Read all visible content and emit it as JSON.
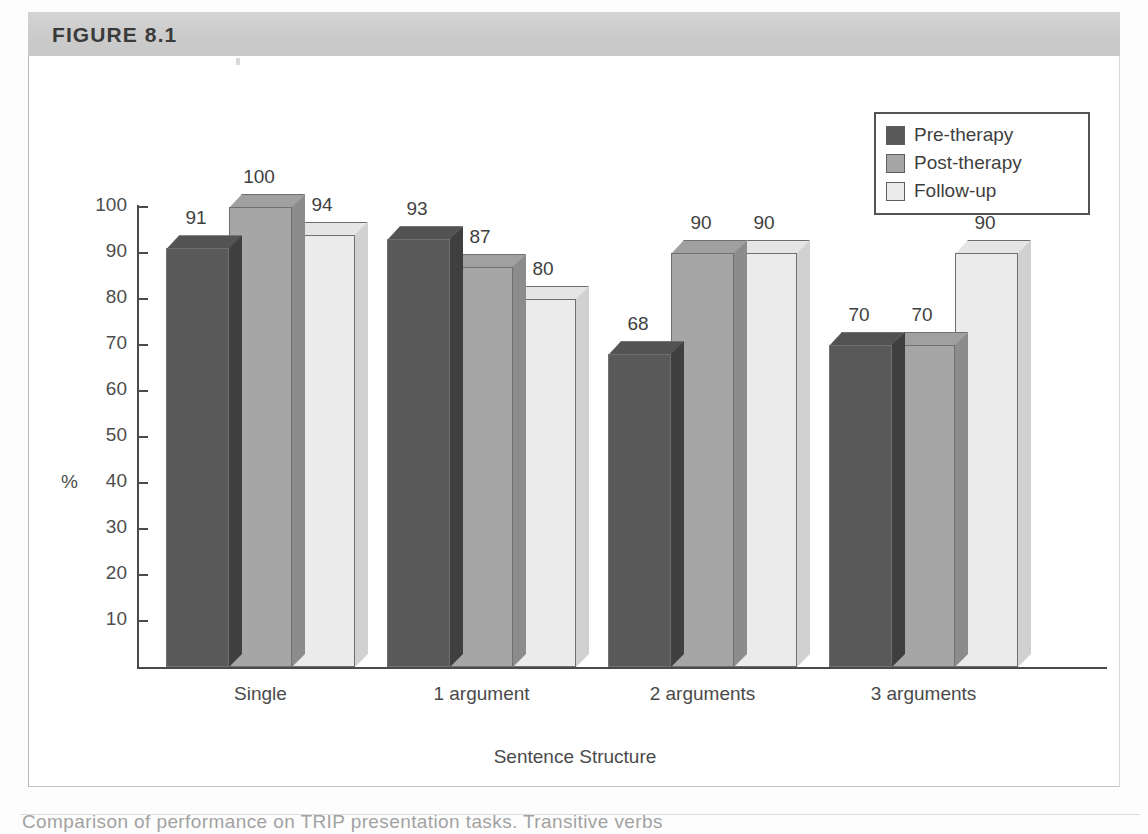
{
  "figure": {
    "label": "FIGURE 8.1",
    "header_color": "#cfcfcf"
  },
  "caption": {
    "text": "Comparison of performance on TRIP presentation tasks. Transitive verbs"
  },
  "legend": {
    "position": "top-right",
    "items": [
      {
        "label": "Pre-therapy",
        "color": "#595959",
        "swatch_icon": "square-swatch-dark"
      },
      {
        "label": "Post-therapy",
        "color": "#a6a6a6",
        "swatch_icon": "square-swatch-medium"
      },
      {
        "label": "Follow-up",
        "color": "#ebebeb",
        "swatch_icon": "square-swatch-light"
      }
    ]
  },
  "chart_data": {
    "type": "bar",
    "title": "FIGURE 8.1",
    "xlabel": "Sentence Structure",
    "ylabel": "%",
    "ylim": [
      0,
      100
    ],
    "yticks": [
      0,
      10,
      20,
      30,
      40,
      50,
      60,
      70,
      80,
      90,
      100
    ],
    "ytick_labels": [
      "",
      "10",
      "20",
      "30",
      "40",
      "50",
      "60",
      "70",
      "80",
      "90",
      "100"
    ],
    "grid": false,
    "three_d": true,
    "legend_position": "top-right",
    "categories": [
      "Single",
      "1 argument",
      "2 arguments",
      "3 arguments"
    ],
    "series": [
      {
        "name": "Pre-therapy",
        "color": "#595959",
        "values": [
          91,
          93,
          68,
          70
        ]
      },
      {
        "name": "Post-therapy",
        "color": "#a6a6a6",
        "values": [
          100,
          87,
          90,
          70
        ]
      },
      {
        "name": "Follow-up",
        "color": "#ebebeb",
        "values": [
          94,
          80,
          90,
          90
        ]
      }
    ],
    "data_labels": [
      [
        "91",
        "100",
        "94"
      ],
      [
        "93",
        "87",
        "80"
      ],
      [
        "68",
        "90",
        "90"
      ],
      [
        "70",
        "70",
        "90"
      ]
    ]
  },
  "colors": {
    "pre_therapy": "#595959",
    "post_therapy": "#a6a6a6",
    "follow_up": "#ebebeb",
    "axis": "#4a4a4a",
    "text": "#3f3f3f"
  }
}
